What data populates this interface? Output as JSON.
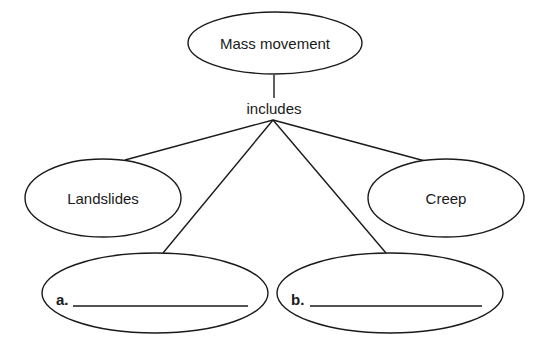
{
  "diagram": {
    "type": "concept-map",
    "root": {
      "label": "Mass movement"
    },
    "connector_label": "includes",
    "children": [
      {
        "label": "Landslides"
      },
      {
        "label": "Creep"
      }
    ],
    "blanks": [
      {
        "label": "a.",
        "value": ""
      },
      {
        "label": "b.",
        "value": ""
      }
    ],
    "colors": {
      "stroke": "#1a1a1a",
      "background": "#ffffff"
    }
  }
}
